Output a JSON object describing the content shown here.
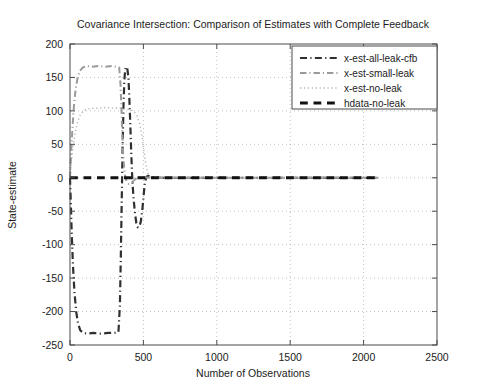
{
  "chart_data": {
    "type": "line",
    "title": "Covariance Intersection: Comparison of Estimates with Complete Feedback",
    "xlabel": "Number of Observations",
    "ylabel": "State-estimate",
    "xlim": [
      0,
      2500
    ],
    "ylim": [
      -250,
      200
    ],
    "xticks": [
      0,
      500,
      1000,
      1500,
      2000,
      2500
    ],
    "yticks": [
      -250,
      -200,
      -150,
      -100,
      -50,
      0,
      50,
      100,
      150,
      200
    ],
    "grid": true,
    "legend_position": "top-right",
    "series": [
      {
        "name": "x-est-all-leak-cfb",
        "style": "dashdot",
        "color": "#303030",
        "width": 2.2,
        "points": [
          [
            0,
            0
          ],
          [
            6,
            -40
          ],
          [
            12,
            -85
          ],
          [
            20,
            -130
          ],
          [
            30,
            -170
          ],
          [
            42,
            -200
          ],
          [
            55,
            -218
          ],
          [
            70,
            -228
          ],
          [
            90,
            -232
          ],
          [
            120,
            -233
          ],
          [
            160,
            -232
          ],
          [
            210,
            -233
          ],
          [
            260,
            -232
          ],
          [
            300,
            -232
          ],
          [
            330,
            -231
          ],
          [
            340,
            -190
          ],
          [
            346,
            -120
          ],
          [
            352,
            -40
          ],
          [
            358,
            40
          ],
          [
            364,
            105
          ],
          [
            370,
            145
          ],
          [
            376,
            162
          ],
          [
            382,
            166
          ],
          [
            390,
            164
          ],
          [
            398,
            150
          ],
          [
            404,
            120
          ],
          [
            410,
            85
          ],
          [
            416,
            45
          ],
          [
            422,
            10
          ],
          [
            428,
            -15
          ],
          [
            436,
            -38
          ],
          [
            444,
            -55
          ],
          [
            452,
            -68
          ],
          [
            462,
            -74
          ],
          [
            472,
            -73
          ],
          [
            482,
            -66
          ],
          [
            492,
            -50
          ],
          [
            500,
            -30
          ],
          [
            508,
            -12
          ],
          [
            516,
            -2
          ],
          [
            524,
            2
          ],
          [
            534,
            3
          ],
          [
            546,
            2
          ],
          [
            560,
            1
          ],
          [
            580,
            1
          ],
          [
            620,
            0
          ],
          [
            700,
            0
          ],
          [
            800,
            0
          ],
          [
            1000,
            0
          ],
          [
            1300,
            0
          ],
          [
            1600,
            0
          ],
          [
            1900,
            0
          ],
          [
            2100,
            0
          ]
        ]
      },
      {
        "name": "x-est-small-leak",
        "style": "dashdot",
        "color": "#9a9a9a",
        "width": 2.0,
        "points": [
          [
            0,
            0
          ],
          [
            8,
            38
          ],
          [
            16,
            72
          ],
          [
            26,
            105
          ],
          [
            38,
            132
          ],
          [
            52,
            150
          ],
          [
            68,
            160
          ],
          [
            88,
            165
          ],
          [
            115,
            167
          ],
          [
            150,
            166
          ],
          [
            195,
            167
          ],
          [
            240,
            166
          ],
          [
            285,
            167
          ],
          [
            320,
            166
          ],
          [
            335,
            165
          ],
          [
            344,
            140
          ],
          [
            350,
            105
          ],
          [
            356,
            68
          ],
          [
            362,
            35
          ],
          [
            370,
            12
          ],
          [
            378,
            0
          ],
          [
            388,
            -6
          ],
          [
            400,
            -9
          ],
          [
            415,
            -8
          ],
          [
            430,
            -5
          ],
          [
            445,
            -2
          ],
          [
            460,
            0
          ],
          [
            480,
            1
          ],
          [
            500,
            1
          ],
          [
            540,
            0
          ],
          [
            600,
            0
          ],
          [
            700,
            0
          ],
          [
            900,
            0
          ],
          [
            1200,
            0
          ],
          [
            1500,
            0
          ],
          [
            1800,
            0
          ],
          [
            2100,
            0
          ]
        ]
      },
      {
        "name": "x-est-no-leak",
        "style": "dotted",
        "color": "#b4b4b4",
        "width": 1.4,
        "points": [
          [
            0,
            0
          ],
          [
            10,
            25
          ],
          [
            22,
            48
          ],
          [
            36,
            68
          ],
          [
            52,
            84
          ],
          [
            70,
            94
          ],
          [
            92,
            100
          ],
          [
            120,
            103
          ],
          [
            155,
            104
          ],
          [
            200,
            104
          ],
          [
            250,
            105
          ],
          [
            300,
            104
          ],
          [
            340,
            104
          ],
          [
            370,
            103
          ],
          [
            400,
            102
          ],
          [
            430,
            100
          ],
          [
            455,
            94
          ],
          [
            475,
            80
          ],
          [
            492,
            60
          ],
          [
            505,
            38
          ],
          [
            516,
            20
          ],
          [
            528,
            8
          ],
          [
            540,
            2
          ],
          [
            556,
            0
          ],
          [
            580,
            0
          ],
          [
            640,
            0
          ],
          [
            740,
            0
          ],
          [
            900,
            0
          ],
          [
            1200,
            0
          ],
          [
            1500,
            0
          ],
          [
            1800,
            0
          ],
          [
            2100,
            0
          ]
        ]
      },
      {
        "name": "hdata-no-leak",
        "style": "dashed",
        "color": "#111111",
        "width": 3.0,
        "points": [
          [
            0,
            0
          ],
          [
            100,
            0
          ],
          [
            300,
            0
          ],
          [
            500,
            0
          ],
          [
            700,
            0
          ],
          [
            900,
            0
          ],
          [
            1100,
            0
          ],
          [
            1300,
            0
          ],
          [
            1500,
            0
          ],
          [
            1700,
            0
          ],
          [
            1900,
            0
          ],
          [
            2100,
            0
          ]
        ]
      }
    ]
  },
  "legend": {
    "items": [
      {
        "label": "x-est-all-leak-cfb"
      },
      {
        "label": "x-est-small-leak"
      },
      {
        "label": "x-est-no-leak"
      },
      {
        "label": "hdata-no-leak"
      }
    ]
  }
}
